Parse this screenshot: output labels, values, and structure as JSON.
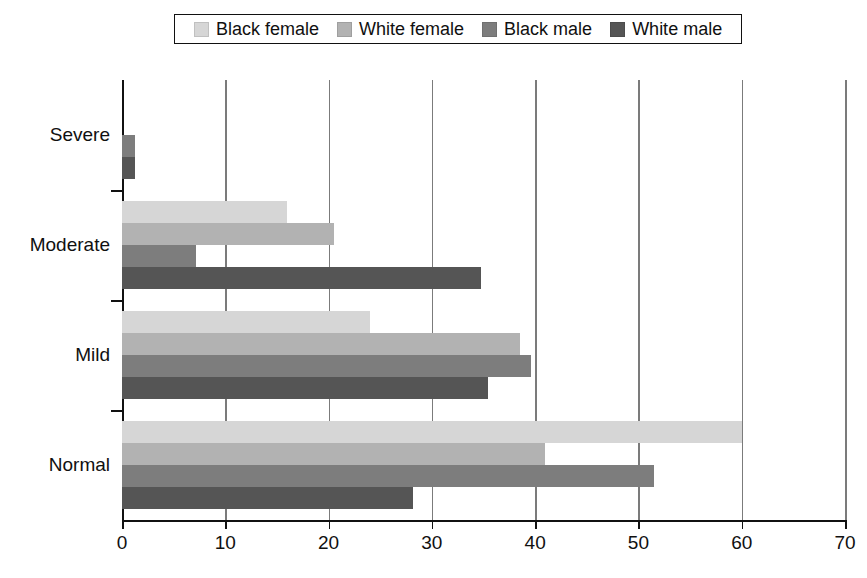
{
  "legend": {
    "position": "top-center",
    "entries": [
      {
        "label": "Black female",
        "color": "#d6d6d6"
      },
      {
        "label": "White female",
        "color": "#b2b2b2"
      },
      {
        "label": "Black male",
        "color": "#7d7d7d"
      },
      {
        "label": "White male",
        "color": "#555555"
      }
    ]
  },
  "axis": {
    "x_ticks": [
      "0",
      "10",
      "20",
      "30",
      "40",
      "50",
      "60",
      "70"
    ],
    "x_tick_values": [
      0,
      10,
      20,
      30,
      40,
      50,
      60,
      70
    ],
    "y_categories": [
      "Severe",
      "Moderate",
      "Mild",
      "Normal"
    ]
  },
  "chart_data": {
    "type": "bar",
    "orientation": "horizontal",
    "title": "",
    "subtitle": "",
    "xlabel": "",
    "ylabel": "",
    "xlim": [
      0,
      70
    ],
    "xticks": [
      0,
      10,
      20,
      30,
      40,
      50,
      60,
      70
    ],
    "grid": "vertical",
    "legend_position": "top-center",
    "categories": [
      "Severe",
      "Moderate",
      "Mild",
      "Normal"
    ],
    "series": [
      {
        "name": "Black female",
        "color": "#d6d6d6",
        "values": [
          0,
          16.0,
          24.0,
          60.0
        ]
      },
      {
        "name": "White female",
        "color": "#b2b2b2",
        "values": [
          0,
          20.5,
          38.5,
          41.0
        ]
      },
      {
        "name": "Black male",
        "color": "#7d7d7d",
        "values": [
          1.3,
          7.2,
          39.6,
          51.5
        ]
      },
      {
        "name": "White male",
        "color": "#555555",
        "values": [
          1.3,
          34.8,
          35.4,
          28.2
        ]
      }
    ]
  },
  "colors": {
    "axis": "#111111",
    "gridline": "#7b7b7b",
    "background": "#ffffff",
    "text": "#101010"
  }
}
